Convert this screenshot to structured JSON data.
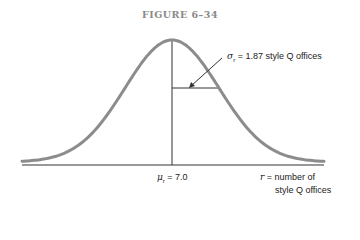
{
  "figure": {
    "title": "FIGURE 6–34"
  },
  "labels": {
    "sigma_symbol": "σ",
    "sigma_sub": "r",
    "sigma_text": " = 1.87 style Q offices",
    "mu_symbol": "μ",
    "mu_sub": "r",
    "mu_text": " = 7.0",
    "r_symbol": "r",
    "r_text_line1": " = number of",
    "r_text_line2": "style Q offices"
  },
  "colors": {
    "curve": "#8c8c8c",
    "axis": "#333333",
    "title": "#8a8a8a"
  },
  "chart_data": {
    "type": "line",
    "title": "FIGURE 6–34",
    "mean": 7.0,
    "std_dev": 1.87,
    "xlabel": "r = number of style Q offices",
    "ylabel": "",
    "x_tick_labels": [
      "μr = 7.0"
    ],
    "annotations": [
      "σr = 1.87 style Q offices",
      "μr = 7.0"
    ],
    "grid": false,
    "legend": null
  }
}
